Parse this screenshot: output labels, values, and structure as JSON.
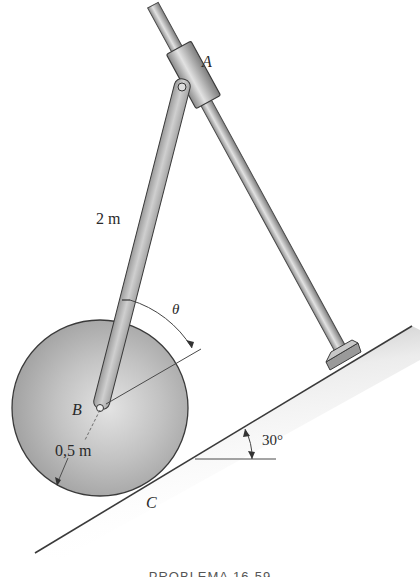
{
  "figure": {
    "labels": {
      "point_a": "A",
      "point_b": "B",
      "point_c": "C",
      "link_length": "2 m",
      "radius": "0,5 m",
      "angle_theta": "θ",
      "incline_angle": "30°"
    },
    "caption": "PROBLEMA 16-59"
  },
  "colors": {
    "background": "#ffffff",
    "outline": "#3a3a3a",
    "metal_light": "#d8d8d8",
    "metal_dark": "#8e8e8e",
    "disk": "#b5b5b5"
  },
  "geometry": {
    "disk_center": [
      100,
      408
    ],
    "disk_radius": 88,
    "incline_angle_deg": 30,
    "link_length_m": 2,
    "disk_radius_m": 0.5
  }
}
